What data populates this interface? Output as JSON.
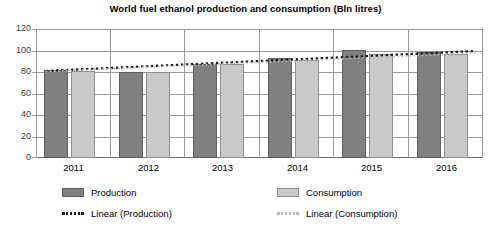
{
  "chart_data": {
    "type": "bar",
    "title": "World fuel ethanol production and consumption (Bln litres)",
    "xlabel": "",
    "ylabel": "",
    "ylim": [
      0,
      120
    ],
    "yticks": [
      0,
      20,
      40,
      60,
      80,
      100,
      120
    ],
    "grid": true,
    "legend_position": "bottom",
    "categories": [
      "2011",
      "2012",
      "2013",
      "2014",
      "2015",
      "2016"
    ],
    "series": [
      {
        "name": "Production",
        "values": [
          82,
          80,
          87,
          93,
          100,
          99
        ],
        "color": "#808080"
      },
      {
        "name": "Consumption",
        "values": [
          81,
          80,
          87,
          91,
          97,
          97
        ],
        "color": "#c9c9c9"
      }
    ],
    "trendlines": [
      {
        "name": "Linear (Production)",
        "start": 81.0,
        "end": 99.5,
        "style": "dotted",
        "color": "#1a1a1a"
      },
      {
        "name": "Linear (Consumption)",
        "start": 80.5,
        "end": 97.5,
        "style": "dotted",
        "color": "#b9b9b9"
      }
    ],
    "legend": [
      {
        "label": "Production",
        "marker": "swatch-dark"
      },
      {
        "label": "Consumption",
        "marker": "swatch-light"
      },
      {
        "label": "Linear (Production)",
        "marker": "dots-dark"
      },
      {
        "label": "Linear (Consumption)",
        "marker": "dots-light"
      }
    ]
  }
}
